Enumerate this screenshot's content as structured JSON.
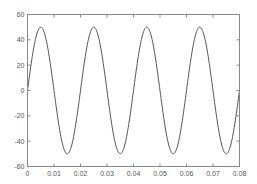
{
  "chart_data": {
    "type": "line",
    "title": "",
    "xlabel": "",
    "ylabel": "",
    "xlim": [
      0,
      0.08
    ],
    "ylim": [
      -60,
      60
    ],
    "grid": false,
    "legend": null,
    "x_ticks": [
      0,
      0.01,
      0.02,
      0.03,
      0.04,
      0.05,
      0.06,
      0.07,
      0.08
    ],
    "x_tick_labels": [
      "0",
      "0.01",
      "0.02",
      "0.03",
      "0.04",
      "0.05",
      "0.06",
      "0.07",
      "0.08"
    ],
    "y_ticks": [
      -60,
      -40,
      -20,
      0,
      20,
      40,
      60
    ],
    "y_tick_labels": [
      "-60",
      "-40",
      "-20",
      "0",
      "20",
      "40",
      "60"
    ],
    "series": [
      {
        "name": "signal",
        "color": "#555555",
        "function": "50*sin(2*pi*50*t)",
        "amplitude": 50,
        "frequency_hz": 50,
        "x": [
          0,
          0.0025,
          0.005,
          0.0075,
          0.01,
          0.0125,
          0.015,
          0.0175,
          0.02,
          0.0225,
          0.025,
          0.0275,
          0.03,
          0.0325,
          0.035,
          0.0375,
          0.04,
          0.0425,
          0.045,
          0.0475,
          0.05,
          0.0525,
          0.055,
          0.0575,
          0.06,
          0.0625,
          0.065,
          0.0675,
          0.07,
          0.0725,
          0.075,
          0.0775,
          0.08
        ],
        "values": [
          0,
          35.4,
          50,
          35.4,
          0,
          -35.4,
          -50,
          -35.4,
          0,
          35.4,
          50,
          35.4,
          0,
          -35.4,
          -50,
          -35.4,
          0,
          35.4,
          50,
          35.4,
          0,
          -35.4,
          -50,
          -35.4,
          0,
          35.4,
          50,
          35.4,
          0,
          -35.4,
          -50,
          -35.4,
          0
        ]
      }
    ]
  },
  "colors": {
    "axis": "#888888",
    "line": "#555555",
    "text": "#555555",
    "background": "#ffffff"
  }
}
